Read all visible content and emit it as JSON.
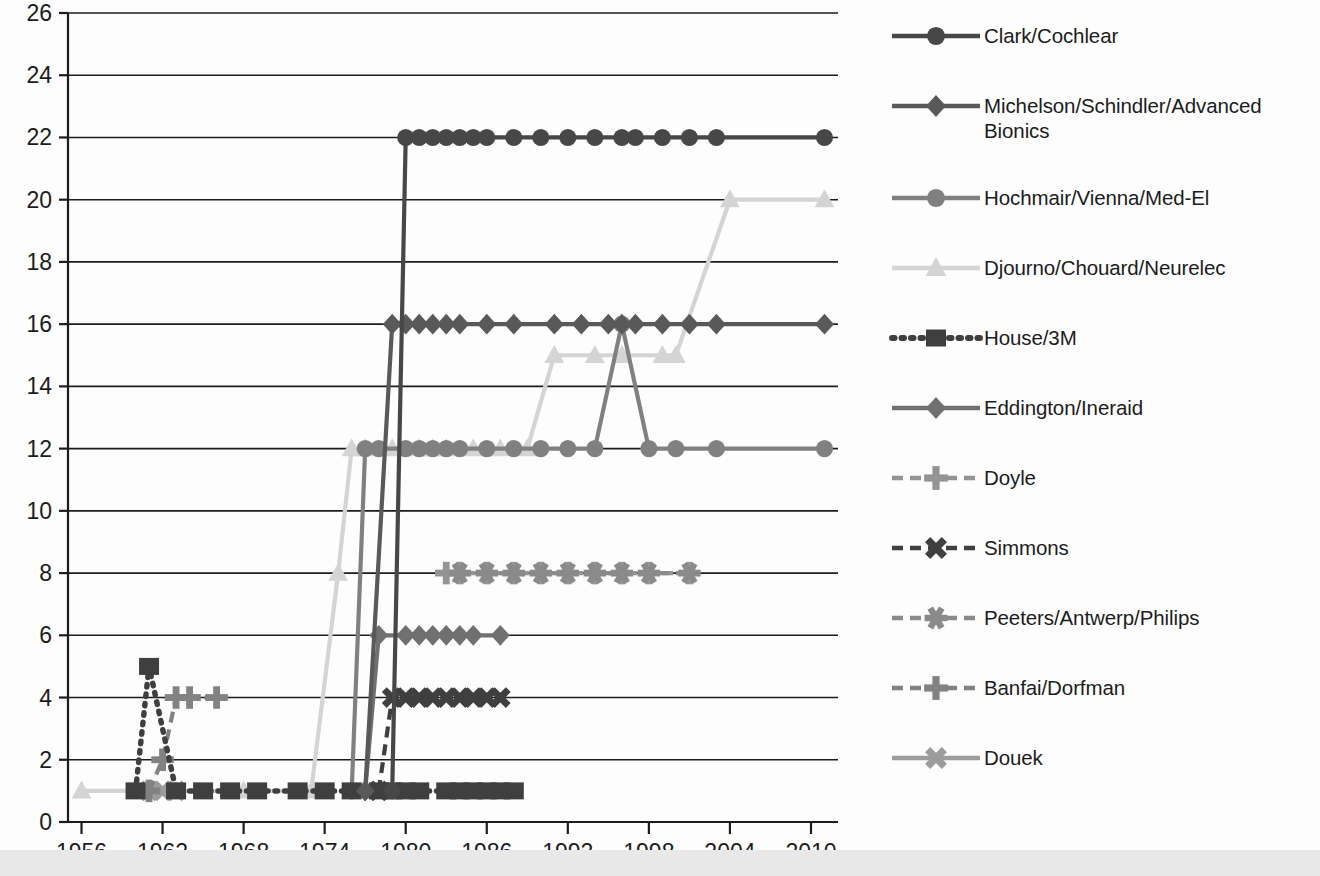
{
  "chart_data": {
    "type": "line",
    "title": "",
    "xlabel": "",
    "ylabel": "",
    "xlim": [
      1955,
      2012
    ],
    "ylim": [
      0,
      26
    ],
    "grid": "horizontal",
    "legend_position": "right",
    "x_ticks": [
      1956,
      1962,
      1968,
      1974,
      1980,
      1986,
      1992,
      1998,
      2004,
      2010
    ],
    "y_ticks": [
      0,
      2,
      4,
      6,
      8,
      10,
      12,
      14,
      16,
      18,
      20,
      22,
      24,
      26
    ],
    "series": [
      {
        "name": "Clark/Cochlear",
        "color": "#474747",
        "marker": "circle",
        "dash": "solid",
        "x": [
          1979,
          1980,
          1981,
          1982,
          1983,
          1984,
          1985,
          1986,
          1988,
          1990,
          1992,
          1994,
          1996,
          1997,
          1999,
          2001,
          2003,
          2011
        ],
        "y": [
          1,
          22,
          22,
          22,
          22,
          22,
          22,
          22,
          22,
          22,
          22,
          22,
          22,
          22,
          22,
          22,
          22,
          22
        ]
      },
      {
        "name": "Michelson/Schindler/Advanced Bionics",
        "color": "#595959",
        "marker": "diamond",
        "dash": "solid",
        "x": [
          1977,
          1979,
          1980,
          1981,
          1982,
          1983,
          1984,
          1986,
          1988,
          1991,
          1993,
          1995,
          1996,
          1997,
          1999,
          2001,
          2003,
          2011
        ],
        "y": [
          1,
          16,
          16,
          16,
          16,
          16,
          16,
          16,
          16,
          16,
          16,
          16,
          16,
          16,
          16,
          16,
          16,
          16
        ]
      },
      {
        "name": "Hochmair/Vienna/Med-El",
        "color": "#808080",
        "marker": "circle",
        "dash": "solid",
        "x": [
          1976,
          1977,
          1978,
          1980,
          1981,
          1982,
          1983,
          1984,
          1986,
          1988,
          1990,
          1992,
          1994,
          1996,
          1998,
          2000,
          2003,
          2011
        ],
        "y": [
          1,
          12,
          12,
          12,
          12,
          12,
          12,
          12,
          12,
          12,
          12,
          12,
          12,
          16,
          12,
          12,
          12,
          12
        ]
      },
      {
        "name": "Djourno/Chouard/Neurelec",
        "color": "#d4d4d4",
        "marker": "triangle",
        "dash": "solid",
        "x": [
          1956,
          1963,
          1968,
          1973,
          1975,
          1976,
          1977,
          1979,
          1981,
          1982,
          1983,
          1985,
          1987,
          1989,
          1991,
          1994,
          1996,
          1999,
          2000,
          2004,
          2011
        ],
        "y": [
          1,
          1,
          1,
          1,
          8,
          12,
          12,
          12,
          12,
          12,
          12,
          12,
          12,
          12,
          15,
          15,
          15,
          15,
          15,
          20,
          20
        ]
      },
      {
        "name": "House/3M",
        "color": "#3f3f3f",
        "marker": "square",
        "dash": "dotted",
        "x": [
          1960,
          1961,
          1963,
          1965,
          1967,
          1969,
          1972,
          1974,
          1976,
          1978,
          1979,
          1980,
          1981,
          1983,
          1984,
          1985,
          1986,
          1987,
          1988
        ],
        "y": [
          1,
          5,
          1,
          1,
          1,
          1,
          1,
          1,
          1,
          1,
          1,
          1,
          1,
          1,
          1,
          1,
          1,
          1,
          1
        ]
      },
      {
        "name": "Eddington/Ineraid",
        "color": "#707070",
        "marker": "diamond",
        "dash": "solid",
        "x": [
          1977,
          1978,
          1980,
          1981,
          1982,
          1983,
          1984,
          1985,
          1987
        ],
        "y": [
          1,
          6,
          6,
          6,
          6,
          6,
          6,
          6,
          6
        ]
      },
      {
        "name": "Doyle",
        "color": "#949494",
        "marker": "plus",
        "dash": "dashed",
        "x": [
          1983,
          1984,
          1986,
          1988,
          1990,
          1992,
          1994,
          1996,
          1998,
          2001
        ],
        "y": [
          8,
          8,
          8,
          8,
          8,
          8,
          8,
          8,
          8,
          8
        ]
      },
      {
        "name": "Simmons",
        "color": "#3f3f3f",
        "marker": "x",
        "dash": "dashed",
        "x": [
          1978,
          1979,
          1980,
          1981,
          1982,
          1983,
          1984,
          1985,
          1986,
          1987
        ],
        "y": [
          1,
          4,
          4,
          4,
          4,
          4,
          4,
          4,
          4,
          4
        ]
      },
      {
        "name": "Peeters/Antwerp/Philips",
        "color": "#8a8a8a",
        "marker": "asterisk",
        "dash": "dashed",
        "x": [
          1984,
          1986,
          1988,
          1990,
          1992,
          1994,
          1996,
          1998,
          2001
        ],
        "y": [
          8,
          8,
          8,
          8,
          8,
          8,
          8,
          8,
          8
        ]
      },
      {
        "name": "Banfai/Dorfman",
        "color": "#828282",
        "marker": "plus",
        "dash": "dashed",
        "x": [
          1961,
          1962,
          1963,
          1964,
          1966
        ],
        "y": [
          1,
          2,
          4,
          4,
          4
        ]
      },
      {
        "name": "Douek",
        "color": "#9c9c9c",
        "marker": "x",
        "dash": "solid",
        "x": [
          1961,
          1962,
          1963
        ],
        "y": [
          1,
          1,
          1
        ]
      }
    ]
  },
  "legend": {
    "entries": [
      {
        "label": "Clark/Cochlear"
      },
      {
        "label": "Michelson/Schindler/Advanced Bionics"
      },
      {
        "label": "Hochmair/Vienna/Med-El"
      },
      {
        "label": "Djourno/Chouard/Neurelec"
      },
      {
        "label": "House/3M"
      },
      {
        "label": "Eddington/Ineraid"
      },
      {
        "label": "Doyle"
      },
      {
        "label": "Simmons"
      },
      {
        "label": "Peeters/Antwerp/Philips"
      },
      {
        "label": "Banfai/Dorfman"
      },
      {
        "label": "Douek"
      }
    ]
  },
  "axis": {
    "y_labels": [
      "0",
      "2",
      "4",
      "6",
      "8",
      "10",
      "12",
      "14",
      "16",
      "18",
      "20",
      "22",
      "24",
      "26"
    ],
    "x_labels": [
      "1956",
      "1962",
      "1968",
      "1974",
      "1980",
      "1986",
      "1992",
      "1998",
      "2004",
      "2010"
    ]
  },
  "colors": {
    "axis": "#1c1c1c",
    "grid": "#1c1c1c",
    "background": "#ffffff",
    "band": "#e8e8e8"
  }
}
